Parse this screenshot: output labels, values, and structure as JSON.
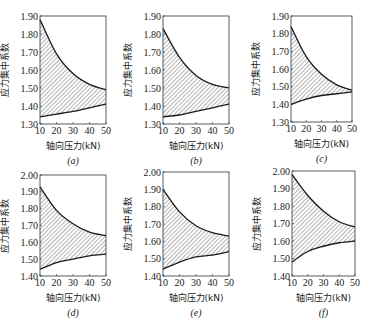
{
  "chart_data": [
    {
      "id": "a",
      "type": "area",
      "caption": "(a)",
      "xlabel": "轴向压力(kN)",
      "ylabel": "应力集中系数",
      "x": [
        10,
        20,
        30,
        40,
        50
      ],
      "xticks": [
        "10",
        "20",
        "30",
        "40",
        "50"
      ],
      "ylim": [
        1.3,
        1.9
      ],
      "yticks": [
        "1.30",
        "1.40",
        "1.50",
        "1.60",
        "1.70",
        "1.80",
        "1.90"
      ],
      "series": [
        {
          "name": "upper",
          "values": [
            1.88,
            1.69,
            1.58,
            1.52,
            1.49
          ]
        },
        {
          "name": "lower",
          "values": [
            1.34,
            1.355,
            1.37,
            1.39,
            1.41
          ]
        }
      ],
      "fill": "hatched region between upper and lower curves",
      "grid": false,
      "box": {
        "left": 40,
        "top": 16,
        "width": 66,
        "height": 108
      }
    },
    {
      "id": "b",
      "type": "area",
      "caption": "(b)",
      "xlabel": "轴向压力(kN)",
      "ylabel": "应力集中系数",
      "x": [
        10,
        20,
        30,
        40,
        50
      ],
      "xticks": [
        "10",
        "20",
        "30",
        "40",
        "50"
      ],
      "ylim": [
        1.3,
        1.9
      ],
      "yticks": [
        "1.30",
        "1.40",
        "1.50",
        "1.60",
        "1.70",
        "1.80",
        "1.90"
      ],
      "series": [
        {
          "name": "upper",
          "values": [
            1.83,
            1.67,
            1.57,
            1.52,
            1.5
          ]
        },
        {
          "name": "lower",
          "values": [
            1.34,
            1.35,
            1.37,
            1.39,
            1.41
          ]
        }
      ],
      "fill": "hatched region between upper and lower curves",
      "grid": false,
      "box": {
        "left": 163,
        "top": 16,
        "width": 66,
        "height": 108
      }
    },
    {
      "id": "c",
      "type": "area",
      "caption": "(c)",
      "xlabel": "轴向压力(kN)",
      "ylabel": "应力集中系数",
      "x": [
        10,
        20,
        30,
        40,
        50
      ],
      "xticks": [
        "10",
        "20",
        "30",
        "40",
        "50"
      ],
      "ylim": [
        1.3,
        1.9
      ],
      "yticks": [
        "1.30",
        "1.40",
        "1.50",
        "1.60",
        "1.70",
        "1.80",
        "1.90"
      ],
      "series": [
        {
          "name": "upper",
          "values": [
            1.84,
            1.67,
            1.57,
            1.51,
            1.48
          ]
        },
        {
          "name": "lower",
          "values": [
            1.4,
            1.43,
            1.45,
            1.46,
            1.47
          ]
        }
      ],
      "fill": "hatched region between upper and lower curves",
      "grid": false,
      "box": {
        "left": 291,
        "top": 16,
        "width": 61,
        "height": 106
      }
    },
    {
      "id": "d",
      "type": "area",
      "caption": "(d)",
      "xlabel": "轴向压力(kN)",
      "ylabel": "应力集中系数",
      "x": [
        10,
        20,
        30,
        40,
        50
      ],
      "xticks": [
        "10",
        "20",
        "30",
        "40",
        "50"
      ],
      "ylim": [
        1.4,
        2.0
      ],
      "yticks": [
        "1.40",
        "1.50",
        "1.60",
        "1.70",
        "1.80",
        "1.90",
        "2.00"
      ],
      "series": [
        {
          "name": "upper",
          "values": [
            1.93,
            1.79,
            1.71,
            1.66,
            1.64
          ]
        },
        {
          "name": "lower",
          "values": [
            1.44,
            1.48,
            1.5,
            1.52,
            1.53
          ]
        }
      ],
      "fill": "hatched region between upper and lower curves",
      "grid": false,
      "box": {
        "left": 40,
        "top": 175,
        "width": 66,
        "height": 101
      }
    },
    {
      "id": "e",
      "type": "area",
      "caption": "(e)",
      "xlabel": "轴向压力(kN)",
      "ylabel": "应力集中系数",
      "x": [
        10,
        20,
        30,
        40,
        50
      ],
      "xticks": [
        "10",
        "20",
        "30",
        "40",
        "50"
      ],
      "ylim": [
        1.4,
        2.0
      ],
      "yticks": [
        "1.40",
        "1.50",
        "1.60",
        "1.70",
        "1.80",
        "1.90",
        "2.00"
      ],
      "series": [
        {
          "name": "upper",
          "values": [
            1.9,
            1.77,
            1.69,
            1.65,
            1.63
          ]
        },
        {
          "name": "lower",
          "values": [
            1.44,
            1.48,
            1.51,
            1.52,
            1.54
          ]
        }
      ],
      "fill": "hatched region between upper and lower curves",
      "grid": false,
      "box": {
        "left": 163,
        "top": 172,
        "width": 66,
        "height": 104
      }
    },
    {
      "id": "f",
      "type": "area",
      "caption": "(f)",
      "xlabel": "轴向压力(kN)",
      "ylabel": "应力集中系数",
      "x": [
        10,
        20,
        30,
        40,
        50
      ],
      "xticks": [
        "10",
        "20",
        "30",
        "40",
        "50"
      ],
      "ylim": [
        1.4,
        2.0
      ],
      "yticks": [
        "1.40",
        "1.50",
        "1.60",
        "1.70",
        "1.80",
        "1.90",
        "2.00"
      ],
      "series": [
        {
          "name": "upper",
          "values": [
            1.98,
            1.86,
            1.77,
            1.71,
            1.68
          ]
        },
        {
          "name": "lower",
          "values": [
            1.48,
            1.54,
            1.57,
            1.59,
            1.6
          ]
        }
      ],
      "fill": "hatched region between upper and lower curves",
      "grid": false,
      "box": {
        "left": 292,
        "top": 171,
        "width": 63,
        "height": 105
      }
    }
  ],
  "colors": {
    "line": "#1a1a1a",
    "hatch": "#444444",
    "frame": "#333333",
    "background": "#ffffff"
  }
}
